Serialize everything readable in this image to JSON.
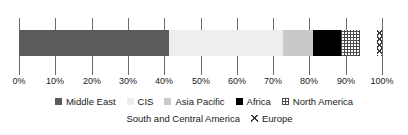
{
  "chart_data": {
    "type": "bar",
    "orientation": "horizontal",
    "stacked": true,
    "title": "",
    "subtitle": "",
    "xlabel": "",
    "ylabel": "",
    "categories": [
      ""
    ],
    "xlim": [
      0,
      100
    ],
    "grid": true,
    "legend_position": "bottom",
    "tick_labels": [
      "0%",
      "10%",
      "20%",
      "30%",
      "40%",
      "50%",
      "60%",
      "70%",
      "80%",
      "90%",
      "100%"
    ],
    "tick_values": [
      0,
      10,
      20,
      30,
      40,
      50,
      60,
      70,
      80,
      90,
      100
    ],
    "series": [
      {
        "name": "Middle East",
        "value": 41.3,
        "cumulative": 41.3,
        "fill": "solid-dark-gray",
        "color": "#5b5b5b"
      },
      {
        "name": "CIS",
        "value": 31.4,
        "cumulative": 72.7,
        "fill": "solid-very-light",
        "color": "#eeeeee"
      },
      {
        "name": "Asia Pacific",
        "value": 8.3,
        "cumulative": 81.0,
        "fill": "solid-light-gray",
        "color": "#c9c9c9"
      },
      {
        "name": "Africa",
        "value": 7.7,
        "cumulative": 88.7,
        "fill": "solid-black",
        "color": "#000000"
      },
      {
        "name": "North America",
        "value": 5.2,
        "cumulative": 93.9,
        "fill": "grid-hatch",
        "color": "#4a4a4a"
      },
      {
        "name": "South and Central America",
        "value": 4.6,
        "cumulative": 98.5,
        "fill": "diagonal-hatch",
        "color": "#3a3a3a"
      },
      {
        "name": "Europe",
        "value": 1.5,
        "cumulative": 100.0,
        "fill": "cross-diagonal-hatch",
        "color": "#3a3a3a"
      }
    ]
  },
  "legend": {
    "row1": [
      {
        "label": "Middle East"
      },
      {
        "label": "CIS"
      },
      {
        "label": "Asia Pacific"
      },
      {
        "label": "Africa"
      },
      {
        "label": "North America"
      }
    ],
    "row2": [
      {
        "label": "South and Central America"
      },
      {
        "label": "Europe"
      }
    ]
  }
}
